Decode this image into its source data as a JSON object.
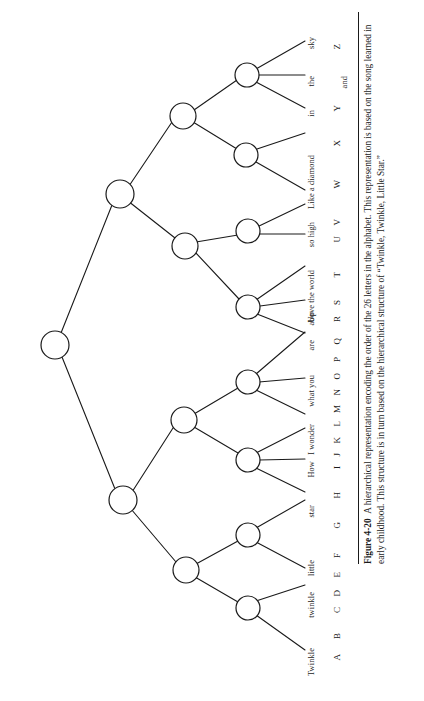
{
  "figure": {
    "number": "Figure 4-20",
    "caption": "A hierarchical representation encoding the order of the 26 letters in the alphabet. This representation is based on the song learned in early childhood. This structure is in turn based on the hierarchical structure of “Twinkle, Twinkle, Little Star.”",
    "caption_lines": [
      "A hierarchical representation encoding the order of the 26 letters in",
      "the alphabet. This representation is based on the song learned in early childhood.",
      "This structure is in turn based on the hierarchical structure of “Twinkle, Twinkle,",
      "Little Star.”"
    ]
  },
  "chart_data": {
    "type": "diagram",
    "orientation": "horizontal-tree-rotated-90",
    "root": "root",
    "levels": 5,
    "node_count_internal": 13,
    "leaf_count": 26,
    "letters": [
      "A",
      "B",
      "C",
      "D",
      "E",
      "F",
      "G",
      "H",
      "I",
      "J",
      "K",
      "L",
      "M",
      "N",
      "O",
      "P",
      "Q",
      "R",
      "S",
      "T",
      "U",
      "V",
      "W",
      "X",
      "Y",
      "Z"
    ],
    "lyric_groups": [
      {
        "text": "Twinkle",
        "letters": [
          "A",
          "B"
        ]
      },
      {
        "text": "twinkle",
        "letters": [
          "C",
          "D"
        ]
      },
      {
        "text": "little",
        "letters": [
          "E",
          "F"
        ]
      },
      {
        "text": "star",
        "letters": [
          "G"
        ]
      },
      {
        "text": "How",
        "letters": [
          "H"
        ]
      },
      {
        "text": "I wonder",
        "letters": [
          "I",
          "J"
        ]
      },
      {
        "text": "what you",
        "letters": [
          "K",
          "L",
          "M"
        ]
      },
      {
        "text": "are",
        "letters": [
          "N",
          "O",
          "P"
        ]
      },
      {
        "text": "Up",
        "letters": [
          "Q"
        ]
      },
      {
        "text": "above the world",
        "letters": [
          "R",
          "S"
        ]
      },
      {
        "text": "so high",
        "letters": [
          "T",
          "U"
        ]
      },
      {
        "text": "Like a diamond",
        "letters": [
          "V",
          "W"
        ]
      },
      {
        "text": "in",
        "letters": [
          "X"
        ]
      },
      {
        "text": "the",
        "letters": [
          "Y"
        ]
      },
      {
        "text": "sky",
        "letters": [
          "Z"
        ]
      }
    ],
    "leaves": [
      {
        "index": 0,
        "letter": "A",
        "word": "Twinkle"
      },
      {
        "index": 1,
        "letter": "B",
        "word": ""
      },
      {
        "index": 2,
        "letter": "C",
        "word": "twinkle"
      },
      {
        "index": 3,
        "letter": "D",
        "word": ""
      },
      {
        "index": 4,
        "letter": "E",
        "word": "little"
      },
      {
        "index": 5,
        "letter": "F",
        "word": ""
      },
      {
        "index": 6,
        "letter": "G",
        "word": "star"
      },
      {
        "index": 7,
        "letter": "H",
        "word": "How"
      },
      {
        "index": 8,
        "letter": "I",
        "word": "I wonder"
      },
      {
        "index": 9,
        "letter": "J",
        "word": ""
      },
      {
        "index": 10,
        "letter": "K",
        "word": "what you"
      },
      {
        "index": 11,
        "letter": "L",
        "word": ""
      },
      {
        "index": 12,
        "letter": "M",
        "word": ""
      },
      {
        "index": 13,
        "letter": "N",
        "word": "are"
      },
      {
        "index": 14,
        "letter": "O",
        "word": ""
      },
      {
        "index": 15,
        "letter": "P",
        "word": ""
      },
      {
        "index": 16,
        "letter": "Q",
        "word": "Up"
      },
      {
        "index": 17,
        "letter": "R",
        "word": "above the world"
      },
      {
        "index": 18,
        "letter": "S",
        "word": ""
      },
      {
        "index": 19,
        "letter": "T",
        "word": ""
      },
      {
        "index": 20,
        "letter": "U",
        "word": "so high"
      },
      {
        "index": 21,
        "letter": "V",
        "word": ""
      },
      {
        "index": 22,
        "letter": "W",
        "word": "Like a diamond"
      },
      {
        "index": 23,
        "letter": "X",
        "word": ""
      },
      {
        "index": 24,
        "letter": "Y",
        "word": "in"
      },
      {
        "index": 25,
        "letter": "Z",
        "word": "the"
      }
    ],
    "extra_leaf_labels": [
      "sky",
      "and"
    ],
    "colors": {
      "stroke": "#1a1a1a",
      "node_fill": "#ffffff",
      "text": "#1a1a1a",
      "background": "#ffffff"
    }
  },
  "word_labels": [
    {
      "text": "Twinkle",
      "y": 648
    },
    {
      "text": "twinkle",
      "y": 592
    },
    {
      "text": "little",
      "y": 560
    },
    {
      "text": "star",
      "y": 505
    },
    {
      "text": "How",
      "y": 461
    },
    {
      "text": "I wonder",
      "y": 424
    },
    {
      "text": "what you",
      "y": 375
    },
    {
      "text": "are",
      "y": 340
    },
    {
      "text": "Up",
      "y": 312
    },
    {
      "text": "above the world",
      "y": 270
    },
    {
      "text": "so high",
      "y": 222
    },
    {
      "text": "Like a diamond",
      "y": 155
    },
    {
      "text": "in",
      "y": 110
    },
    {
      "text": "the",
      "y": 76
    },
    {
      "text": "sky",
      "y": 37
    }
  ],
  "letter_labels": [
    {
      "text": "A",
      "y": 654
    },
    {
      "text": "B",
      "y": 633
    },
    {
      "text": "C",
      "y": 607
    },
    {
      "text": "D",
      "y": 590
    },
    {
      "text": "E",
      "y": 572
    },
    {
      "text": "F",
      "y": 553
    },
    {
      "text": "G",
      "y": 522
    },
    {
      "text": "H",
      "y": 492
    },
    {
      "text": "I",
      "y": 466
    },
    {
      "text": "J",
      "y": 453
    },
    {
      "text": "K",
      "y": 437
    },
    {
      "text": "L",
      "y": 421
    },
    {
      "text": "M",
      "y": 405
    },
    {
      "text": "N",
      "y": 389
    },
    {
      "text": "O",
      "y": 373
    },
    {
      "text": "P",
      "y": 357
    },
    {
      "text": "Q",
      "y": 338
    },
    {
      "text": "R",
      "y": 316
    },
    {
      "text": "S",
      "y": 300
    },
    {
      "text": "T",
      "y": 272
    },
    {
      "text": "U",
      "y": 236
    },
    {
      "text": "V",
      "y": 219
    },
    {
      "text": "W",
      "y": 180
    },
    {
      "text": "X",
      "y": 140
    },
    {
      "text": "Y",
      "y": 105
    },
    {
      "text": "Z",
      "y": 44
    }
  ],
  "extra_labels": [
    {
      "text": "and",
      "y": 76,
      "x": 341
    }
  ]
}
